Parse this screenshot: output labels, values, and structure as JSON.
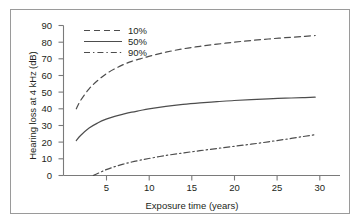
{
  "figure": {
    "frame_color": "#9a9a9a",
    "background": "#ffffff",
    "line_color": "#4d4d4d",
    "axis_color": "#7a7a7a"
  },
  "chart_data": {
    "type": "line",
    "title": "",
    "xlabel": "Exposure time (years)",
    "ylabel": "Hearing loss at 4 kHz (dB)",
    "xlim": [
      0,
      32
    ],
    "ylim": [
      0,
      90
    ],
    "xticks": [
      5,
      10,
      15,
      20,
      25,
      30
    ],
    "yticks": [
      0,
      10,
      20,
      30,
      40,
      50,
      60,
      70,
      80,
      90
    ],
    "grid": false,
    "legend_position": "top-left",
    "series": [
      {
        "name": "10%",
        "style": "dashed",
        "x": [
          1.5,
          2,
          3,
          4,
          5,
          6,
          7,
          8,
          9,
          10,
          12,
          14,
          16,
          18,
          20,
          22,
          24,
          26,
          28,
          29.5
        ],
        "y": [
          40,
          45,
          52,
          57,
          61,
          64,
          66.5,
          68.5,
          70,
          71.5,
          74,
          76,
          77.5,
          78.8,
          80,
          81,
          81.9,
          82.7,
          83.4,
          84
        ]
      },
      {
        "name": "50%",
        "style": "solid",
        "x": [
          1.5,
          2,
          3,
          4,
          5,
          6,
          7,
          8,
          9,
          10,
          12,
          14,
          16,
          18,
          20,
          22,
          24,
          26,
          28,
          29.5
        ],
        "y": [
          21,
          24,
          28.5,
          31.5,
          33.8,
          35.5,
          36.8,
          38,
          39,
          40,
          41.5,
          42.7,
          43.6,
          44.3,
          45,
          45.5,
          46,
          46.4,
          46.7,
          47
        ]
      },
      {
        "name": "90%",
        "style": "dash-dot",
        "x": [
          3.5,
          4,
          5,
          6,
          7,
          8,
          9,
          10,
          12,
          14,
          16,
          18,
          20,
          22,
          24,
          26,
          28,
          29.5
        ],
        "y": [
          0,
          1.2,
          3.5,
          5.3,
          6.8,
          8.1,
          9.2,
          10.2,
          12,
          13.5,
          14.9,
          16.2,
          17.5,
          18.8,
          20.2,
          21.7,
          23.3,
          24.5
        ]
      }
    ],
    "legend": [
      {
        "label": "10%",
        "style": "dashed"
      },
      {
        "label": "50%",
        "style": "solid"
      },
      {
        "label": "90%",
        "style": "dash-dot"
      }
    ]
  }
}
